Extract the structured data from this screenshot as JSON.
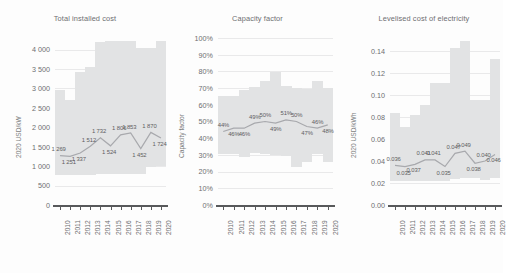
{
  "figure": {
    "background_color": "#fdfdfd",
    "band_color": "#e2e3e4",
    "line_color": "#a8a9ad",
    "axis_color": "#58595b",
    "text_color": "#6d6e71"
  },
  "chart_data": [
    {
      "type": "area",
      "title": "Total installed cost",
      "ylabel": "2020 USD/kW",
      "xlabel": "",
      "categories": [
        "2010",
        "2011",
        "2012",
        "2013",
        "2014",
        "2015",
        "2016",
        "2017",
        "2018",
        "2019",
        "2020"
      ],
      "x": [
        2010,
        2011,
        2012,
        2013,
        2014,
        2015,
        2016,
        2017,
        2018,
        2019,
        2020
      ],
      "ylim": [
        0,
        4300
      ],
      "yticks": [
        0,
        500,
        1000,
        1500,
        2000,
        2500,
        3000,
        3500,
        4000
      ],
      "ytick_labels": [
        "0",
        "500",
        "1 000",
        "1 500",
        "2 000",
        "2 500",
        "3 000",
        "3 500",
        "4 000"
      ],
      "grid": true,
      "legend": "none",
      "series": [
        {
          "name": "Weighted average",
          "values": [
            1269,
            1251,
            1337,
            1512,
            1732,
            1524,
            1806,
            1853,
            1452,
            1870,
            1724
          ],
          "labels": [
            "1 269",
            "1 251",
            "1 337",
            "1 512",
            "1 732",
            "1 524",
            "1 806",
            "1 853",
            "1 452",
            "1 870",
            "1 724"
          ]
        },
        {
          "name": "5th percentile (band low)",
          "values": [
            780,
            770,
            775,
            780,
            790,
            795,
            800,
            810,
            800,
            990,
            1000
          ]
        },
        {
          "name": "95th percentile (band high)",
          "values": [
            2950,
            2700,
            3420,
            3560,
            4200,
            4230,
            4230,
            4230,
            4040,
            4040,
            4230
          ]
        }
      ]
    },
    {
      "type": "area",
      "title": "Capacity factor",
      "ylabel": "Capacity factor",
      "xlabel": "",
      "categories": [
        "2010",
        "2011",
        "2012",
        "2013",
        "2014",
        "2015",
        "2016",
        "2017",
        "2018",
        "2019",
        "2020"
      ],
      "x": [
        2010,
        2011,
        2012,
        2013,
        2014,
        2015,
        2016,
        2017,
        2018,
        2019,
        2020
      ],
      "ylim": [
        0,
        1.0
      ],
      "yticks": [
        0,
        0.1,
        0.2,
        0.3,
        0.4,
        0.5,
        0.6,
        0.7,
        0.8,
        0.9,
        1.0
      ],
      "ytick_labels": [
        "0%",
        "10%",
        "20%",
        "30%",
        "40%",
        "50%",
        "60%",
        "70%",
        "80%",
        "90%",
        "100%"
      ],
      "grid": true,
      "legend": "none",
      "series": [
        {
          "name": "Weighted average",
          "values": [
            0.44,
            0.46,
            0.46,
            0.49,
            0.5,
            0.49,
            0.51,
            0.5,
            0.47,
            0.46,
            0.48,
            0.46
          ],
          "labels": [
            "44%",
            "46%",
            "46%",
            "49%",
            "50%",
            "49%",
            "51%",
            "50%",
            "47%",
            "46%",
            "48%",
            "46%"
          ],
          "displayed_labels": [
            "44%",
            "46%",
            "49%",
            "50%",
            "49%",
            "51%",
            "50%",
            "47%",
            "46%",
            "48%",
            "46%"
          ]
        },
        {
          "name": "5th percentile (band low)",
          "values": [
            0.305,
            0.305,
            0.29,
            0.31,
            0.305,
            0.3,
            0.295,
            0.225,
            0.255,
            0.305,
            0.26
          ]
        },
        {
          "name": "95th percentile (band high)",
          "values": [
            0.655,
            0.655,
            0.69,
            0.705,
            0.74,
            0.795,
            0.71,
            0.7,
            0.695,
            0.74,
            0.7
          ]
        }
      ]
    },
    {
      "type": "area",
      "title": "Levelised cost of electricity",
      "ylabel": "2020 USD/kWh",
      "xlabel": "",
      "categories": [
        "2010",
        "2011",
        "2012",
        "2013",
        "2014",
        "2015",
        "2016",
        "2017",
        "2018",
        "2019",
        "2020"
      ],
      "x": [
        2010,
        2011,
        2012,
        2013,
        2014,
        2015,
        2016,
        2017,
        2018,
        2019,
        2020
      ],
      "ylim": [
        0,
        0.152
      ],
      "yticks": [
        0.0,
        0.02,
        0.04,
        0.06,
        0.08,
        0.1,
        0.12,
        0.14
      ],
      "ytick_labels": [
        "0.00",
        "0.02",
        "0.04",
        "0.06",
        "0.08",
        "0.10",
        "0.12",
        "0.14"
      ],
      "grid": true,
      "legend": "none",
      "series": [
        {
          "name": "Weighted average",
          "values": [
            0.036,
            0.035,
            0.037,
            0.041,
            0.041,
            0.035,
            0.047,
            0.049,
            0.038,
            0.04,
            0.046
          ],
          "labels": [
            "0.036",
            "0.035",
            "0.037",
            "0.041",
            "0.041",
            "0.035",
            "0.047",
            "0.049",
            "0.038",
            "0.040",
            "0.046"
          ]
        },
        {
          "name": "5th percentile (band low)",
          "values": [
            0.0215,
            0.0215,
            0.0215,
            0.0215,
            0.0215,
            0.0215,
            0.0235,
            0.0245,
            0.0245,
            0.0225,
            0.0245
          ]
        },
        {
          "name": "95th percentile (band high)",
          "values": [
            0.084,
            0.071,
            0.082,
            0.091,
            0.111,
            0.111,
            0.143,
            0.149,
            0.096,
            0.096,
            0.133
          ]
        }
      ]
    }
  ]
}
